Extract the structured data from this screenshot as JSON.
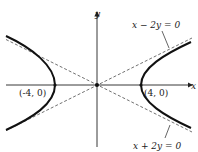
{
  "diagram": {
    "type": "hyperbola",
    "equation_implied": "x^2/16 - y^2/4 = 1",
    "axes": {
      "x_label": "x",
      "y_label": "y"
    },
    "vertices": [
      {
        "label": "(-4, 0)",
        "x": -4,
        "y": 0
      },
      {
        "label": "(4, 0)",
        "x": 4,
        "y": 0
      }
    ],
    "asymptotes": [
      {
        "label": "x − 2y = 0",
        "slope": 0.5
      },
      {
        "label": "x + 2y = 0",
        "slope": -0.5
      }
    ],
    "colors": {
      "curve": "#111111",
      "axes": "#222222",
      "asymptote": "#333333"
    }
  }
}
